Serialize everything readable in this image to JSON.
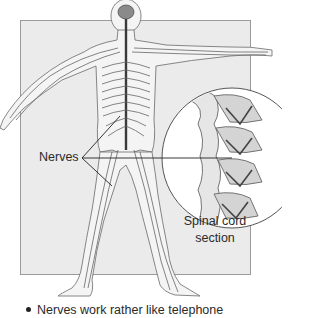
{
  "figure": {
    "labels": {
      "nerves": "Nerves",
      "spinal_cord_line1": "Spinal cord",
      "spinal_cord_line2": "section"
    },
    "colors": {
      "panel_background": "#ebebeb",
      "panel_border": "#9a9a9a",
      "nerve_stroke": "#555555",
      "spinal_cord": "#3a3a3a",
      "inset_background": "#ffffff"
    }
  },
  "caption": {
    "bullet_text": "Nerves work rather like telephone"
  }
}
